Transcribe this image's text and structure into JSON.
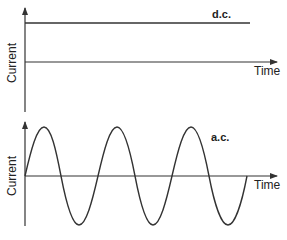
{
  "panels": [
    {
      "id": "dc",
      "tag": "d.c.",
      "x_label": "Time",
      "y_label": "Current"
    },
    {
      "id": "ac",
      "tag": "a.c.",
      "x_label": "Time",
      "y_label": "Current"
    }
  ],
  "colors": {
    "line": "#333333",
    "background": "#ffffff"
  }
}
